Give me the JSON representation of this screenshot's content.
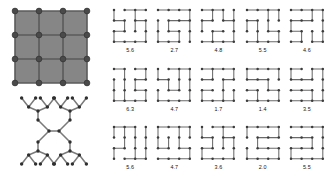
{
  "figure": {
    "type": "diagram",
    "colors": {
      "lattice_face": "#868686",
      "lattice_edge": "#5a5a5a",
      "node": "#3c3c3c",
      "tree_edge": "#6a6a6a",
      "background": "#ffffff"
    }
  },
  "left_panel": {
    "lattice": {
      "name": "square-lattice",
      "rows": 4,
      "cols": 4,
      "cells": 9,
      "node_count": 16,
      "filled": true
    },
    "tree": {
      "name": "symmetric-binary-tree",
      "leaf_count": 16,
      "depth": 3
    }
  },
  "sample_grid": {
    "rows": 3,
    "cols": 5,
    "cells": [
      {
        "row": 0,
        "col": 0,
        "label": "5.6",
        "seed": 11
      },
      {
        "row": 0,
        "col": 1,
        "label": "2.7",
        "seed": 23
      },
      {
        "row": 0,
        "col": 2,
        "label": "4.8",
        "seed": 37
      },
      {
        "row": 0,
        "col": 3,
        "label": "5.5",
        "seed": 41
      },
      {
        "row": 0,
        "col": 4,
        "label": "4.6",
        "seed": 59
      },
      {
        "row": 1,
        "col": 0,
        "label": "6.3",
        "seed": 67
      },
      {
        "row": 1,
        "col": 1,
        "label": "4.7",
        "seed": 73
      },
      {
        "row": 1,
        "col": 2,
        "label": "1.7",
        "seed": 89
      },
      {
        "row": 1,
        "col": 3,
        "label": "1.4",
        "seed": 97
      },
      {
        "row": 1,
        "col": 4,
        "label": "3.5",
        "seed": 103
      },
      {
        "row": 2,
        "col": 0,
        "label": "5.6",
        "seed": 113
      },
      {
        "row": 2,
        "col": 1,
        "label": "4.7",
        "seed": 127
      },
      {
        "row": 2,
        "col": 2,
        "label": "3.6",
        "seed": 139
      },
      {
        "row": 2,
        "col": 3,
        "label": "2.0",
        "seed": 149
      },
      {
        "row": 2,
        "col": 4,
        "label": "5.5",
        "seed": 157
      }
    ]
  }
}
